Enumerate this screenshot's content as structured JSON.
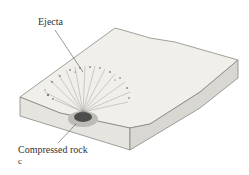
{
  "diagram": {
    "labels": {
      "ejecta": "Ejecta",
      "compressed_rock": "Compressed rock",
      "panel": "c"
    },
    "colors": {
      "surface": "#f1efe9",
      "side": "#e4e2dc",
      "outline": "#6a6a6a",
      "crater": "#3a3a3a",
      "ejecta": "#555555"
    }
  }
}
